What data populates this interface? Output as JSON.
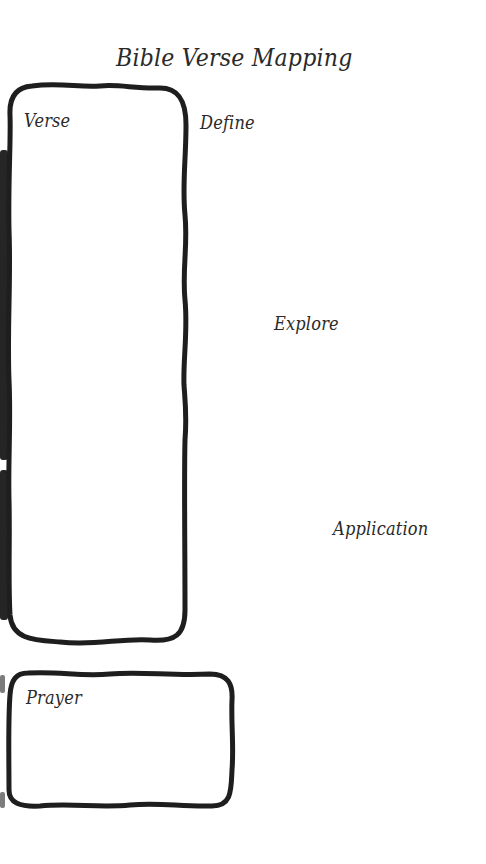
{
  "worksheet": {
    "title": "Bible Verse Mapping",
    "sections": {
      "verse": {
        "label": "Verse"
      },
      "define": {
        "label": "Define"
      },
      "explore": {
        "label": "Explore"
      },
      "application": {
        "label": "Application"
      },
      "prayer": {
        "label": "Prayer"
      }
    },
    "colors": {
      "ink": "#1e1e1e",
      "text": "#2a2a2a",
      "paper": "#ffffff"
    }
  }
}
